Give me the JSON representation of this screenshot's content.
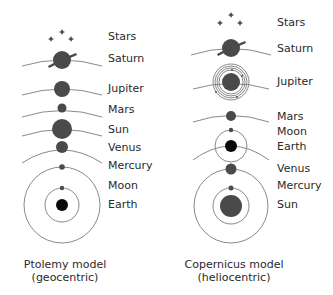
{
  "colors": {
    "planet": "#4a4a4a",
    "earth": "#0a0a0a",
    "orbit": "#8a8a8a",
    "text": "#2a2a2a"
  },
  "geocentric": {
    "caption_line1": "Ptolemy model",
    "caption_line2": "(geocentric)",
    "labels": [
      "Stars",
      "Saturn",
      "Jupiter",
      "Mars",
      "Sun",
      "Venus",
      "Mercury",
      "Moon",
      "Earth"
    ]
  },
  "heliocentric": {
    "caption_line1": "Copernicus model",
    "caption_line2": "(heliocentric)",
    "labels": [
      "Stars",
      "Saturn",
      "Jupiter",
      "Mars",
      "Moon",
      "Earth",
      "Venus",
      "Mercury",
      "Sun"
    ]
  }
}
